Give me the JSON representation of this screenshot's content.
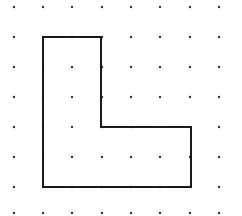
{
  "diagram": {
    "type": "dot-grid-polygon",
    "grid": {
      "columns": [
        14,
        43,
        72,
        102,
        131,
        160,
        190,
        219
      ],
      "rows": [
        7,
        37,
        67,
        97,
        127,
        157,
        187,
        213
      ],
      "dot_color": "#333333",
      "dot_radius": 1.2
    },
    "shape": {
      "name": "L-shape",
      "vertices_grid": [
        [
          1,
          1
        ],
        [
          3,
          1
        ],
        [
          3,
          4
        ],
        [
          6,
          4
        ],
        [
          6,
          6
        ],
        [
          1,
          6
        ]
      ],
      "vertices_px": [
        [
          43,
          37
        ],
        [
          101,
          37
        ],
        [
          101,
          127
        ],
        [
          191,
          127
        ],
        [
          191,
          187
        ],
        [
          43,
          187
        ]
      ],
      "stroke_color": "#1a1a1a",
      "stroke_width": 2
    }
  }
}
